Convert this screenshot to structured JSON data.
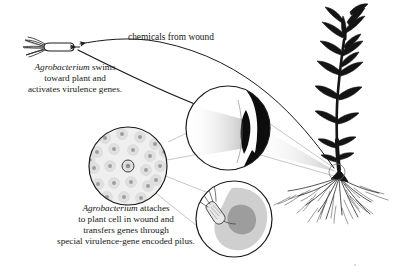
{
  "figure": {
    "background_color": "#ffffff",
    "ink_color": "#1a1a1a"
  },
  "labels": {
    "chemicals_from_wound": "chemicals from wound"
  },
  "captions": {
    "swims": {
      "lines": [
        "Agrobacterium swims",
        "toward plant and",
        "activates virulence genes."
      ],
      "italic_word": "Agrobacterium",
      "line1_rest": " swims",
      "line2": "toward plant and",
      "line3": "activates virulence genes."
    },
    "attaches": {
      "lines": [
        "Agrobacterium attaches",
        "to plant cell in wound and",
        "transfers genes through",
        "special virulence-gene encoded pilus."
      ],
      "italic_word": "Agrobacterium",
      "line1_rest": " attaches",
      "line2": "to plant cell in wound and",
      "line3": "transfers genes through",
      "line4": "special virulence-gene encoded pilus."
    }
  },
  "elements": {
    "bacterium_free": "free-swimming Agrobacterium cell with flagella",
    "plant": "flowering plant with stem, leaves and fibrous roots",
    "wound_site": "wound site circled on lower stem",
    "inset_wound": "magnified wound cross-section",
    "inset_tissue": "magnified plant tissue with cells",
    "inset_cell": "magnified single plant cell with attached bacterium",
    "arrow_chemicals": "curved arrow from wound to bacterium",
    "arrow_swim": "curved arrow from bacterium to wound inset"
  },
  "colors": {
    "ink": "#1a1a1a",
    "cell_fill": "#d9d9d9",
    "nucleus_fill": "#a8a8a8",
    "tissue_fill": "#ececec",
    "shadow_gray": "#cccccc",
    "leader_line": "#999999"
  }
}
